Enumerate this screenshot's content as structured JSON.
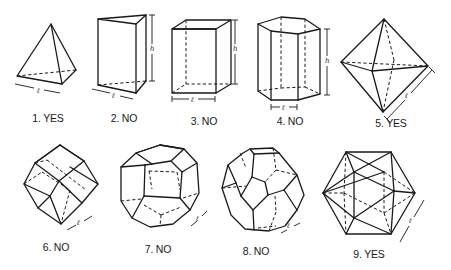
{
  "figure": {
    "solids": [
      {
        "id": 1,
        "name": "tetrahedron",
        "label": "1. YES",
        "dimensions": [
          "ℓ"
        ],
        "label_pos": {
          "x": 48,
          "y": 118
        }
      },
      {
        "id": 2,
        "name": "triangular-prism",
        "label": "2. NO",
        "dimensions": [
          "h",
          "ℓ"
        ],
        "label_pos": {
          "x": 122,
          "y": 118
        }
      },
      {
        "id": 3,
        "name": "square-prism",
        "label": "3. NO",
        "dimensions": [
          "h",
          "ℓ"
        ],
        "label_pos": {
          "x": 204,
          "y": 121
        }
      },
      {
        "id": 4,
        "name": "hexagonal-prism",
        "label": "4. NO",
        "dimensions": [
          "h",
          "ℓ"
        ],
        "label_pos": {
          "x": 290,
          "y": 121
        }
      },
      {
        "id": 5,
        "name": "octahedron",
        "label": "5. YES",
        "dimensions": [
          "ℓ"
        ],
        "label_pos": {
          "x": 392,
          "y": 123
        }
      },
      {
        "id": 6,
        "name": "rhombic-dodecahedron",
        "label": "6. NO",
        "dimensions": [
          "ℓ"
        ],
        "label_pos": {
          "x": 56,
          "y": 246
        }
      },
      {
        "id": 7,
        "name": "pentagonal-dodecahedron",
        "label": "7. NO",
        "dimensions": [
          "ℓ"
        ],
        "label_pos": {
          "x": 158,
          "y": 248
        }
      },
      {
        "id": 8,
        "name": "truncated-octahedron",
        "label": "8. NO",
        "dimensions": [
          "ℓ"
        ],
        "label_pos": {
          "x": 257,
          "y": 250
        }
      },
      {
        "id": 9,
        "name": "icosahedron",
        "label": "9. YES",
        "dimensions": [
          "ℓ"
        ],
        "label_pos": {
          "x": 370,
          "y": 253
        }
      }
    ],
    "dimension_symbols": {
      "length": "ℓ",
      "height": "h"
    },
    "colors": {
      "line": "#1a1a1a",
      "background": "#ffffff"
    }
  }
}
